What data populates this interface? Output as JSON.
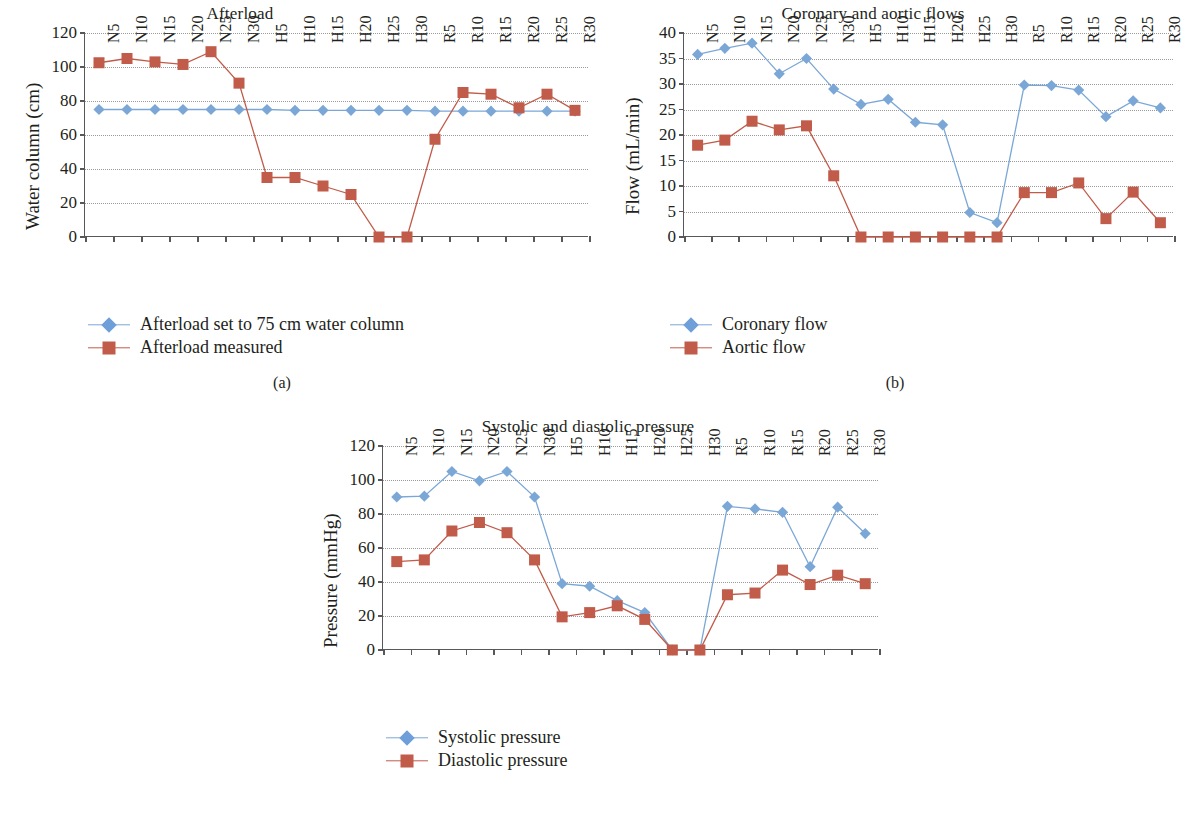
{
  "figure": {
    "captions": {
      "a": "(a)",
      "b": "(b)",
      "c": "(c)"
    }
  },
  "colors": {
    "series_blue": "#7ba7d7",
    "series_red": "#c15b4a",
    "axis": "#58585a",
    "grid": "#9a9a9a",
    "text": "#231f20"
  },
  "chart_data": [
    {
      "id": "afterload",
      "type": "line",
      "title": "Afterload",
      "xlabel": "",
      "ylabel": "Water column (cm)",
      "ylim": [
        0,
        120
      ],
      "yticks": [
        0,
        20,
        40,
        60,
        80,
        100,
        120
      ],
      "grid": true,
      "legend_position": "below",
      "categories": [
        "N5",
        "N10",
        "N15",
        "N20",
        "N25",
        "N30",
        "H5",
        "H10",
        "H15",
        "H20",
        "H25",
        "H30",
        "R5",
        "R10",
        "R15",
        "R20",
        "R25",
        "R30"
      ],
      "series": [
        {
          "name": "Afterload set to 75 cm water column",
          "color": "#7ba7d7",
          "marker": "diamond",
          "values": [
            75,
            75,
            75,
            75,
            75,
            75,
            75,
            74.5,
            74.5,
            74.5,
            74.5,
            74.5,
            74,
            74,
            74,
            74,
            74,
            74
          ]
        },
        {
          "name": "Afterload measured",
          "color": "#c15b4a",
          "marker": "square",
          "values": [
            102.5,
            105,
            103,
            101.5,
            109,
            90.5,
            35,
            35,
            30,
            25,
            0,
            0,
            57.5,
            85,
            84,
            76,
            84,
            74.5
          ]
        }
      ]
    },
    {
      "id": "flows",
      "type": "line",
      "title": "Coronary and aortic flows",
      "xlabel": "",
      "ylabel": "Flow (mL/min)",
      "ylim": [
        0,
        40
      ],
      "yticks": [
        0,
        5,
        10,
        15,
        20,
        25,
        30,
        35,
        40
      ],
      "grid": true,
      "legend_position": "below",
      "categories": [
        "N5",
        "N10",
        "N15",
        "N20",
        "N25",
        "N30",
        "H5",
        "H10",
        "H15",
        "H20",
        "H25",
        "H30",
        "R5",
        "R10",
        "R15",
        "R20",
        "R25",
        "R30"
      ],
      "series": [
        {
          "name": "Coronary flow",
          "color": "#7ba7d7",
          "marker": "diamond",
          "values": [
            35.8,
            37,
            38,
            32,
            35,
            29,
            26,
            27,
            22.5,
            22,
            4.8,
            2.8,
            29.8,
            29.7,
            28.8,
            23.6,
            26.7,
            25.3
          ]
        },
        {
          "name": "Aortic flow",
          "color": "#c15b4a",
          "marker": "square",
          "values": [
            18,
            19,
            22.7,
            21,
            21.8,
            12,
            0,
            0,
            0,
            0,
            0,
            0,
            8.7,
            8.7,
            10.6,
            3.6,
            8.8,
            2.8
          ]
        }
      ]
    },
    {
      "id": "pressure",
      "type": "line",
      "title": "Systolic and diastolic pressure",
      "xlabel": "",
      "ylabel": "Pressure (mmHg)",
      "ylim": [
        0,
        120
      ],
      "yticks": [
        0,
        20,
        40,
        60,
        80,
        100,
        120
      ],
      "grid": true,
      "legend_position": "below",
      "categories": [
        "N5",
        "N10",
        "N15",
        "N20",
        "N25",
        "N30",
        "H5",
        "H10",
        "H15",
        "H20",
        "H25",
        "H30",
        "R5",
        "R10",
        "R15",
        "R20",
        "R25",
        "R30"
      ],
      "series": [
        {
          "name": "Systolic pressure",
          "color": "#7ba7d7",
          "marker": "diamond",
          "values": [
            90,
            90.5,
            105,
            99.5,
            105,
            90,
            39,
            37.5,
            29,
            22,
            0,
            0,
            84.5,
            83,
            81,
            49,
            84,
            68.5
          ]
        },
        {
          "name": "Diastolic pressure",
          "color": "#c15b4a",
          "marker": "square",
          "values": [
            52,
            53,
            70,
            75,
            69,
            53,
            19.5,
            22,
            26,
            18,
            0,
            0,
            32.5,
            33.5,
            47,
            38.5,
            44,
            39
          ]
        }
      ]
    }
  ]
}
